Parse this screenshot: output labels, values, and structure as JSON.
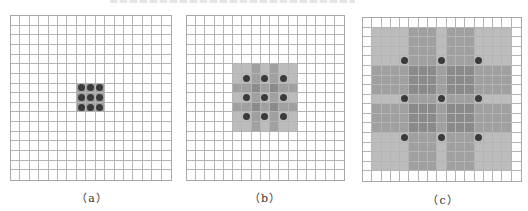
{
  "figure": {
    "grid_size": 17,
    "colors": {
      "grid_line": "#b4b4b4",
      "light": "#bcbcbc",
      "medium": "#a0a0a0",
      "dark": "#8a8a8a",
      "dot": "#3a3a3a",
      "background": "#ffffff"
    },
    "panels": [
      {
        "label": "（a）",
        "rect": {
          "x": 10,
          "y": 15,
          "w": 162,
          "h": 166
        },
        "caption_pos": {
          "x": 62,
          "y": 189
        },
        "shaded_range": [
          7,
          9
        ],
        "dark_bands": [],
        "dots": [
          7,
          8,
          9
        ],
        "shading_mode": "solid"
      },
      {
        "label": "（b）",
        "rect": {
          "x": 186,
          "y": 15,
          "w": 159,
          "h": 166
        },
        "caption_pos": {
          "x": 235,
          "y": 189
        },
        "shaded_range": [
          5,
          11
        ],
        "dark_bands": [
          7,
          9
        ],
        "dots": [
          6,
          8,
          10
        ],
        "shading_mode": "additive"
      },
      {
        "label": "（c）",
        "rect": {
          "x": 362,
          "y": 17,
          "w": 160,
          "h": 165
        },
        "caption_pos": {
          "x": 413,
          "y": 191
        },
        "shaded_range": [
          1,
          15
        ],
        "dark_bands": [
          5,
          6,
          7,
          9,
          10,
          11
        ],
        "dots": [
          4,
          8,
          12
        ],
        "shading_mode": "additive"
      }
    ]
  }
}
